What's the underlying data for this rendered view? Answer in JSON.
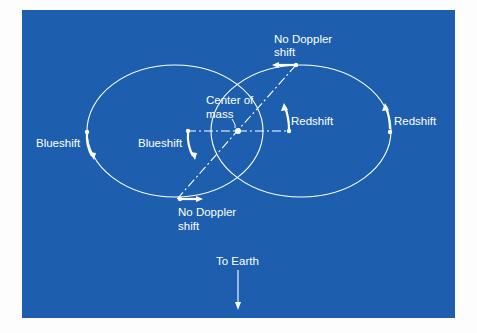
{
  "colors": {
    "background": "#1d5fae",
    "foreground": "#ffffff",
    "page": "#fdfdfd"
  },
  "labels": {
    "no_doppler_top_1": "No Doppler",
    "no_doppler_top_2": "shift",
    "center_of_mass_1": "Center  of",
    "center_of_mass_2": "mass",
    "blueshift_outer": "Blueshift",
    "blueshift_inner": "Blueshift",
    "redshift_inner": "Redshift",
    "redshift_outer": "Redshift",
    "no_doppler_bottom_1": "No Doppler",
    "no_doppler_bottom_2": "shift",
    "to_earth": "To Earth"
  }
}
